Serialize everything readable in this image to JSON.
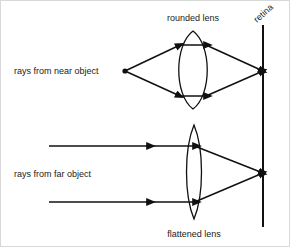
{
  "diagram": {
    "background_color": "#ffffff",
    "ink_color": "#111111",
    "labels": {
      "rounded_lens": "rounded lens",
      "flattened_lens": "flattened lens",
      "retina": "retina",
      "rays_near": "rays from near object",
      "rays_far": "rays from far object"
    },
    "elements": {
      "retina_label_rotation_deg": -42,
      "near_object_point": {
        "x": 124,
        "y": 70
      },
      "near_focus_point": {
        "x": 262,
        "y": 70
      },
      "far_focus_point": {
        "x": 262,
        "y": 172
      },
      "retina_line": {
        "x": 262,
        "y_top": 24,
        "y_bottom": 226
      },
      "rounded_lens": {
        "cx": 192,
        "cy": 69,
        "half_width": 19,
        "half_height": 39
      },
      "flattened_lens": {
        "cx": 193,
        "cy": 171,
        "half_width": 10,
        "half_height": 47
      },
      "near_ray_upper_y_at_lens": 44,
      "near_ray_lower_y_at_lens": 95,
      "far_ray_upper_y": 145,
      "far_ray_lower_y": 201,
      "far_ray_start_x": 48
    }
  }
}
